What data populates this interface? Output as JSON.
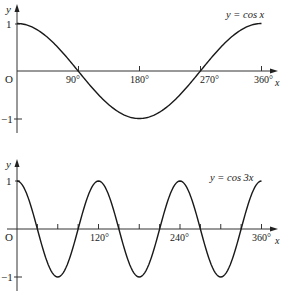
{
  "chart_data": [
    {
      "type": "line",
      "title": "y = cos x",
      "function": "cos x",
      "xlabel": "x",
      "ylabel": "y",
      "origin_label": "O",
      "x_unit": "degrees",
      "xlim": [
        0,
        360
      ],
      "ylim": [
        -1,
        1
      ],
      "x_ticks": [
        90,
        180,
        270,
        360
      ],
      "x_tick_labels": [
        "90°",
        "180°",
        "270°",
        "360°"
      ],
      "y_ticks": [
        1,
        -1
      ],
      "y_tick_labels": [
        "1",
        "−1"
      ],
      "grid": false,
      "legend": "curve label top-right",
      "series": [
        {
          "name": "y = cos x",
          "x": [
            0,
            30,
            60,
            90,
            120,
            150,
            180,
            210,
            240,
            270,
            300,
            330,
            360
          ],
          "values": [
            1,
            0.866,
            0.5,
            0,
            -0.5,
            -0.866,
            -1,
            -0.866,
            -0.5,
            0,
            0.5,
            0.866,
            1
          ]
        }
      ]
    },
    {
      "type": "line",
      "title": "y = cos 3x",
      "function": "cos 3x",
      "xlabel": "x",
      "ylabel": "y",
      "origin_label": "O",
      "x_unit": "degrees",
      "xlim": [
        0,
        360
      ],
      "ylim": [
        -1,
        1
      ],
      "x_ticks": [
        30,
        60,
        90,
        120,
        150,
        180,
        210,
        240,
        270,
        300,
        330,
        360
      ],
      "x_tick_labels": [
        "120°",
        "240°",
        "360°"
      ],
      "x_labeled_ticks": [
        120,
        240,
        360
      ],
      "y_ticks": [
        1,
        -1
      ],
      "y_tick_labels": [
        "1",
        "−1"
      ],
      "grid": false,
      "legend": "curve label top-right",
      "series": [
        {
          "name": "y = cos 3x",
          "x": [
            0,
            30,
            60,
            90,
            120,
            150,
            180,
            210,
            240,
            270,
            300,
            330,
            360
          ],
          "values": [
            1,
            0,
            -1,
            0,
            1,
            0,
            -1,
            0,
            1,
            0,
            -1,
            0,
            1
          ]
        }
      ]
    }
  ],
  "charts": {
    "top": {
      "curve_label": "y = cos x",
      "y_axis_label": "y",
      "x_axis_label": "x",
      "origin": "O",
      "y_max_label": "1",
      "y_min_label": "−1",
      "tick_labels": [
        "90°",
        "180°",
        "270°",
        "360°"
      ]
    },
    "bottom": {
      "curve_label": "y = cos 3x",
      "y_axis_label": "y",
      "x_axis_label": "x",
      "origin": "O",
      "y_max_label": "1",
      "y_min_label": "−1",
      "tick_labels": [
        "120°",
        "240°",
        "360°"
      ]
    }
  },
  "style": {
    "line_color": "#1a1a1a",
    "axis_color": "#333333",
    "background": "#ffffff"
  }
}
